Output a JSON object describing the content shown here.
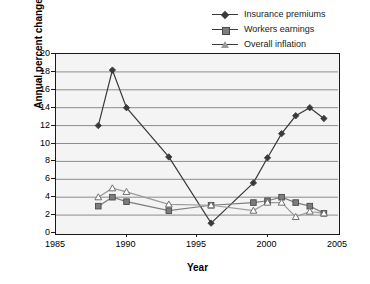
{
  "chart_data": {
    "type": "line",
    "title": "",
    "xlabel": "Year",
    "ylabel": "Annual percent change",
    "xlim": [
      1985,
      2005
    ],
    "ylim": [
      0,
      20
    ],
    "ytick_values": [
      0,
      2,
      4,
      6,
      8,
      10,
      12,
      14,
      16,
      18,
      20
    ],
    "xtick_values": [
      1985,
      1990,
      1995,
      2000,
      2005
    ],
    "grid": "horizontal",
    "legend_position": "top-right",
    "series": [
      {
        "name": "Insurance premiums",
        "marker": "diamond",
        "color": "#3a3a3a",
        "x": [
          1988,
          1989,
          1990,
          1993,
          1996,
          1999,
          2000,
          2001,
          2002,
          2003,
          2004
        ],
        "values": [
          12.0,
          18.2,
          14.0,
          8.5,
          1.1,
          5.6,
          8.4,
          11.1,
          13.1,
          14.0,
          12.8
        ]
      },
      {
        "name": "Workers earnings",
        "marker": "square",
        "color": "#7d7d7d",
        "x": [
          1988,
          1989,
          1990,
          1993,
          1996,
          1999,
          2000,
          2001,
          2002,
          2003,
          2004
        ],
        "values": [
          3.0,
          4.0,
          3.5,
          2.5,
          3.1,
          3.4,
          3.6,
          4.0,
          3.4,
          3.0,
          2.2
        ]
      },
      {
        "name": "Overall inflation",
        "marker": "triangle",
        "color": "#9a9a9a",
        "x": [
          1988,
          1989,
          1990,
          1993,
          1996,
          1999,
          2000,
          2001,
          2002,
          2003,
          2004
        ],
        "values": [
          4.0,
          5.0,
          4.6,
          3.2,
          3.1,
          2.5,
          3.4,
          3.4,
          1.8,
          2.4,
          2.2
        ]
      }
    ]
  },
  "legend": {
    "items": [
      {
        "label": "Insurance premiums",
        "marker": "diamond"
      },
      {
        "label": "Workers earnings",
        "marker": "square"
      },
      {
        "label": "Overall inflation",
        "marker": "triangle"
      }
    ]
  },
  "axes": {
    "y_title": "Annual percent change",
    "x_title": "Year"
  }
}
